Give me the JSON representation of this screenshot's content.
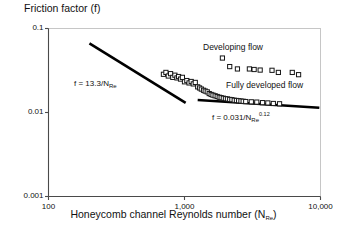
{
  "chart_data": {
    "type": "scatter",
    "title": "Friction factor (f)",
    "xlabel_prefix": "Honeycomb channel Reynolds number (N",
    "xlabel_sub": "Re",
    "xlabel_suffix": ")",
    "ylabel": "Friction factor (f)",
    "xscale": "log",
    "yscale": "log",
    "xlim": [
      100,
      10000
    ],
    "ylim": [
      0.001,
      0.1
    ],
    "grid": false,
    "legend": "none",
    "xticks": [
      "100",
      "1,000",
      "10,000"
    ],
    "xtick_values": [
      100,
      1000,
      10000
    ],
    "yticks": [
      "0.1",
      "0.01",
      "0.001"
    ],
    "ytick_values": [
      0.1,
      0.01,
      0.001
    ],
    "annotations": [
      {
        "name": "developing-flow",
        "text": "Developing flow",
        "x": 2600,
        "y": 0.04
      },
      {
        "name": "fully-developed-flow",
        "text": "Fully developed flow",
        "x": 2800,
        "y": 0.022
      }
    ],
    "fit_lines": [
      {
        "name": "laminar-fit",
        "label_prefix": "f = 13.3/N",
        "label_sub": "Re",
        "label_sup": "",
        "equation": "f = 13.3/N_Re",
        "coefficient": 13.3,
        "exponent": -1,
        "x_start": 200,
        "x_end": 1020,
        "y_start": 0.0665,
        "y_end": 0.013
      },
      {
        "name": "turbulent-fit",
        "label_prefix": "f = 0.031/N",
        "label_sub": "Re",
        "label_sup": "0.12",
        "equation": "f = 0.031/N_Re^0.12",
        "coefficient": 0.031,
        "exponent": -0.12,
        "x_start": 1250,
        "x_end": 9800,
        "y_start": 0.0141,
        "y_end": 0.0114
      }
    ],
    "series": [
      {
        "name": "measured-friction-factors",
        "marker": "open-square",
        "points": [
          [
            700,
            0.0285
          ],
          [
            730,
            0.03
          ],
          [
            760,
            0.0272
          ],
          [
            790,
            0.029
          ],
          [
            820,
            0.0262
          ],
          [
            850,
            0.0278
          ],
          [
            880,
            0.0258
          ],
          [
            905,
            0.0268
          ],
          [
            935,
            0.025
          ],
          [
            965,
            0.0262
          ],
          [
            1000,
            0.0232
          ],
          [
            1040,
            0.024
          ],
          [
            1080,
            0.0225
          ],
          [
            1120,
            0.0234
          ],
          [
            1160,
            0.0219
          ],
          [
            1200,
            0.0228
          ],
          [
            1250,
            0.0202
          ],
          [
            1290,
            0.0196
          ],
          [
            1330,
            0.019
          ],
          [
            1380,
            0.0184
          ],
          [
            1420,
            0.018
          ],
          [
            1470,
            0.0176
          ],
          [
            1520,
            0.0168
          ],
          [
            1570,
            0.0164
          ],
          [
            1620,
            0.0161
          ],
          [
            1680,
            0.0158
          ],
          [
            1740,
            0.0155
          ],
          [
            1800,
            0.0152
          ],
          [
            1860,
            0.015
          ],
          [
            1930,
            0.0148
          ],
          [
            2000,
            0.0146
          ],
          [
            2070,
            0.0145
          ],
          [
            2150,
            0.0143
          ],
          [
            2230,
            0.0142
          ],
          [
            2320,
            0.014
          ],
          [
            2410,
            0.0139
          ],
          [
            2500,
            0.0138
          ],
          [
            2600,
            0.0137
          ],
          [
            2700,
            0.0136
          ],
          [
            2820,
            0.0135
          ],
          [
            1900,
            0.0445
          ],
          [
            2150,
            0.0352
          ],
          [
            2450,
            0.033
          ],
          [
            3000,
            0.033
          ],
          [
            3250,
            0.0325
          ],
          [
            3600,
            0.032
          ],
          [
            4400,
            0.0318
          ],
          [
            4900,
            0.03
          ],
          [
            6200,
            0.03
          ],
          [
            6900,
            0.0282
          ],
          [
            3100,
            0.0134
          ],
          [
            3400,
            0.0133
          ],
          [
            3750,
            0.0131
          ],
          [
            4100,
            0.013
          ],
          [
            4500,
            0.0128
          ],
          [
            5000,
            0.0127
          ]
        ]
      }
    ]
  }
}
